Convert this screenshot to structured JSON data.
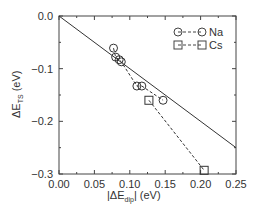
{
  "chart_data": {
    "type": "scatter",
    "title": "",
    "xlabel": "|ΔE_dip| (eV)",
    "ylabel": "ΔE_TS (eV)",
    "xlim": [
      0.0,
      0.25
    ],
    "ylim": [
      -0.3,
      0.0
    ],
    "x_ticks": [
      "0.00",
      "0.05",
      "0.10",
      "0.15",
      "0.20",
      "0.25"
    ],
    "y_ticks": [
      "0.0",
      "-0.1",
      "-0.2",
      "-0.3"
    ],
    "grid": false,
    "legend_position": "upper right",
    "series": [
      {
        "name": "Na",
        "marker": "circle",
        "line": "dashed",
        "points": [
          {
            "x": 0.077,
            "y": -0.061
          },
          {
            "x": 0.08,
            "y": -0.078
          },
          {
            "x": 0.085,
            "y": -0.083
          },
          {
            "x": 0.088,
            "y": -0.087
          },
          {
            "x": 0.11,
            "y": -0.133
          },
          {
            "x": 0.117,
            "y": -0.133
          },
          {
            "x": 0.147,
            "y": -0.16
          }
        ]
      },
      {
        "name": "Cs",
        "marker": "square",
        "line": "dashed",
        "points": [
          {
            "x": 0.127,
            "y": -0.16
          },
          {
            "x": 0.205,
            "y": -0.293
          }
        ]
      },
      {
        "name": "reference line",
        "marker": "none",
        "line": "solid",
        "points": [
          {
            "x": 0.0,
            "y": 0.0
          },
          {
            "x": 0.25,
            "y": -0.25
          }
        ]
      }
    ]
  },
  "labels": {
    "xlabel_prefix": "|ΔE",
    "xlabel_sub": "dip",
    "xlabel_suffix": "| (eV)",
    "ylabel_prefix": "ΔE",
    "ylabel_sub": "TS",
    "ylabel_suffix": " (eV)",
    "legend_na": "Na",
    "legend_cs": "Cs"
  }
}
